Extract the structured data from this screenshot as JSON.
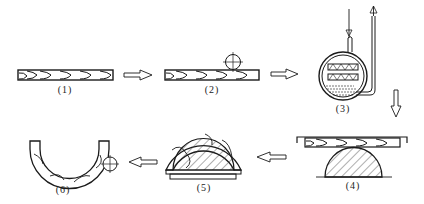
{
  "diagram": {
    "type": "process-flow",
    "stroke_color": "#1a1a1a",
    "background": "#ffffff",
    "steps": [
      {
        "id": 1,
        "label": "(1)",
        "description": "flat strip with layered grain"
      },
      {
        "id": 2,
        "label": "(2)",
        "description": "strip with roller pressing"
      },
      {
        "id": 3,
        "label": "(3)",
        "description": "steaming vessel with inlet and outlet pipes"
      },
      {
        "id": 4,
        "label": "(4)",
        "description": "strip clamped over semicircular mold"
      },
      {
        "id": 5,
        "label": "(5)",
        "description": "strip bent around semicircular mold"
      },
      {
        "id": 6,
        "label": "(6)",
        "description": "finished U-shaped bent part with roller"
      }
    ],
    "arrows": [
      {
        "from": 1,
        "to": 2,
        "direction": "right"
      },
      {
        "from": 2,
        "to": 3,
        "direction": "right"
      },
      {
        "from": 3,
        "to": 4,
        "direction": "down"
      },
      {
        "from": 4,
        "to": 5,
        "direction": "left"
      },
      {
        "from": 5,
        "to": 6,
        "direction": "left"
      }
    ]
  }
}
